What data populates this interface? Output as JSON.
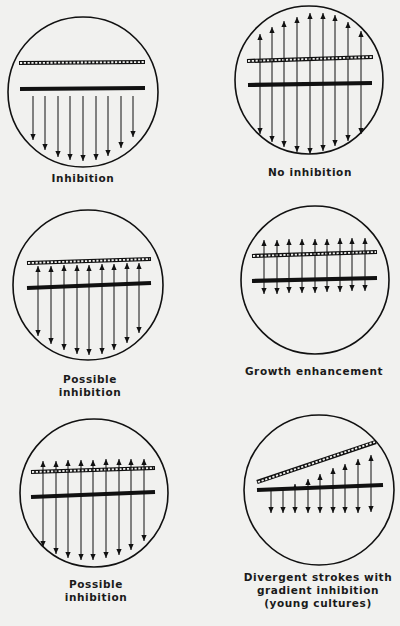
{
  "figure": {
    "panels": [
      {
        "id": "inhibition",
        "caption_lines": [
          "Inhibition"
        ],
        "circle": {
          "cx": 83,
          "cy": 92,
          "r": 75
        },
        "hatched_streak": {
          "x1": 19,
          "y1": 63,
          "x2": 145,
          "y2": 62
        },
        "solid_streak": {
          "x1": 20,
          "y1": 89,
          "x2": 145,
          "y2": 88
        },
        "arrows": [
          {
            "x": 33,
            "y_top": 96,
            "y_bottom": 140,
            "up": false
          },
          {
            "x": 45,
            "y_top": 96,
            "y_bottom": 150,
            "up": false
          },
          {
            "x": 58,
            "y_top": 96,
            "y_bottom": 157,
            "up": false
          },
          {
            "x": 70,
            "y_top": 96,
            "y_bottom": 160,
            "up": false
          },
          {
            "x": 83,
            "y_top": 96,
            "y_bottom": 161,
            "up": false
          },
          {
            "x": 96,
            "y_top": 96,
            "y_bottom": 160,
            "up": false
          },
          {
            "x": 108,
            "y_top": 96,
            "y_bottom": 156,
            "up": false
          },
          {
            "x": 121,
            "y_top": 96,
            "y_bottom": 148,
            "up": false
          },
          {
            "x": 133,
            "y_top": 96,
            "y_bottom": 137,
            "up": false
          }
        ],
        "caption_pos": {
          "x": 83,
          "y": 172
        }
      },
      {
        "id": "no-inhibition",
        "caption_lines": [
          "No inhibition"
        ],
        "circle": {
          "cx": 309,
          "cy": 80,
          "r": 74
        },
        "hatched_streak": {
          "x1": 247,
          "y1": 61,
          "x2": 373,
          "y2": 57
        },
        "solid_streak": {
          "x1": 248,
          "y1": 85,
          "x2": 372,
          "y2": 83
        },
        "arrows": [
          {
            "x": 260,
            "y_top": 34,
            "y_bottom": 134,
            "up": true
          },
          {
            "x": 272,
            "y_top": 27,
            "y_bottom": 142,
            "up": true
          },
          {
            "x": 284,
            "y_top": 21,
            "y_bottom": 147,
            "up": true
          },
          {
            "x": 297,
            "y_top": 17,
            "y_bottom": 152,
            "up": true
          },
          {
            "x": 310,
            "y_top": 13,
            "y_bottom": 154,
            "up": true
          },
          {
            "x": 323,
            "y_top": 13,
            "y_bottom": 151,
            "up": true
          },
          {
            "x": 335,
            "y_top": 15,
            "y_bottom": 146,
            "up": true
          },
          {
            "x": 348,
            "y_top": 22,
            "y_bottom": 141,
            "up": true
          },
          {
            "x": 361,
            "y_top": 31,
            "y_bottom": 134,
            "up": true
          }
        ],
        "caption_pos": {
          "x": 310,
          "y": 166
        }
      },
      {
        "id": "possible-inhibition-1",
        "caption_lines": [
          "Possible",
          "inhibition"
        ],
        "circle": {
          "cx": 88,
          "cy": 285,
          "r": 75
        },
        "hatched_streak": {
          "x1": 27,
          "y1": 263,
          "x2": 151,
          "y2": 259
        },
        "solid_streak": {
          "x1": 27,
          "y1": 288,
          "x2": 151,
          "y2": 283
        },
        "arrows": [
          {
            "x": 38,
            "y_top": 266,
            "y_bottom": 336,
            "up": true
          },
          {
            "x": 51,
            "y_top": 266,
            "y_bottom": 344,
            "up": true
          },
          {
            "x": 64,
            "y_top": 265,
            "y_bottom": 350,
            "up": true
          },
          {
            "x": 77,
            "y_top": 265,
            "y_bottom": 354,
            "up": true
          },
          {
            "x": 89,
            "y_top": 265,
            "y_bottom": 355,
            "up": true
          },
          {
            "x": 102,
            "y_top": 264,
            "y_bottom": 354,
            "up": true
          },
          {
            "x": 114,
            "y_top": 264,
            "y_bottom": 350,
            "up": true
          },
          {
            "x": 127,
            "y_top": 263,
            "y_bottom": 343,
            "up": true
          },
          {
            "x": 139,
            "y_top": 263,
            "y_bottom": 333,
            "up": true
          }
        ],
        "caption_pos": {
          "x": 90,
          "y": 373
        }
      },
      {
        "id": "growth-enhancement",
        "caption_lines": [
          "Growth enhancement"
        ],
        "circle": {
          "cx": 315,
          "cy": 280,
          "r": 74
        },
        "hatched_streak": {
          "x1": 252,
          "y1": 256,
          "x2": 377,
          "y2": 252
        },
        "solid_streak": {
          "x1": 252,
          "y1": 281,
          "x2": 377,
          "y2": 278
        },
        "arrows": [
          {
            "x": 264,
            "y_top": 240,
            "y_bottom": 294,
            "up": true
          },
          {
            "x": 277,
            "y_top": 240,
            "y_bottom": 294,
            "up": true
          },
          {
            "x": 289,
            "y_top": 239,
            "y_bottom": 293,
            "up": true
          },
          {
            "x": 302,
            "y_top": 239,
            "y_bottom": 293,
            "up": true
          },
          {
            "x": 315,
            "y_top": 239,
            "y_bottom": 293,
            "up": true
          },
          {
            "x": 327,
            "y_top": 239,
            "y_bottom": 292,
            "up": true
          },
          {
            "x": 340,
            "y_top": 238,
            "y_bottom": 292,
            "up": true
          },
          {
            "x": 352,
            "y_top": 238,
            "y_bottom": 291,
            "up": true
          },
          {
            "x": 365,
            "y_top": 238,
            "y_bottom": 291,
            "up": true
          }
        ],
        "caption_pos": {
          "x": 314,
          "y": 365
        }
      },
      {
        "id": "possible-inhibition-2",
        "caption_lines": [
          "Possible",
          "inhibition"
        ],
        "circle": {
          "cx": 94,
          "cy": 493,
          "r": 74
        },
        "hatched_streak": {
          "x1": 31,
          "y1": 472,
          "x2": 155,
          "y2": 468
        },
        "solid_streak": {
          "x1": 31,
          "y1": 497,
          "x2": 155,
          "y2": 492
        },
        "arrows": [
          {
            "x": 43,
            "y_top": 461,
            "y_bottom": 547,
            "up": true
          },
          {
            "x": 56,
            "y_top": 461,
            "y_bottom": 554,
            "up": true
          },
          {
            "x": 68,
            "y_top": 460,
            "y_bottom": 558,
            "up": true
          },
          {
            "x": 81,
            "y_top": 460,
            "y_bottom": 560,
            "up": true
          },
          {
            "x": 93,
            "y_top": 460,
            "y_bottom": 560,
            "up": true
          },
          {
            "x": 106,
            "y_top": 459,
            "y_bottom": 558,
            "up": true
          },
          {
            "x": 119,
            "y_top": 459,
            "y_bottom": 555,
            "up": true
          },
          {
            "x": 131,
            "y_top": 459,
            "y_bottom": 550,
            "up": true
          },
          {
            "x": 144,
            "y_top": 459,
            "y_bottom": 541,
            "up": true
          }
        ],
        "caption_pos": {
          "x": 96,
          "y": 578
        }
      },
      {
        "id": "divergent-strokes",
        "caption_lines": [
          "Divergent strokes with",
          "gradient inhibition",
          "(young cultures)"
        ],
        "circle": {
          "cx": 319,
          "cy": 490,
          "r": 75
        },
        "hatched_streak": {
          "x1": 257,
          "y1": 482,
          "x2": 376,
          "y2": 442
        },
        "solid_streak": {
          "x1": 257,
          "y1": 490,
          "x2": 383,
          "y2": 485
        },
        "arrows": [
          {
            "x": 271,
            "y_top": 490,
            "y_bottom": 513,
            "up": false
          },
          {
            "x": 283,
            "y_top": 490,
            "y_bottom": 513,
            "up": false
          },
          {
            "x": 295,
            "y_top": 484,
            "y_bottom": 513,
            "up": true
          },
          {
            "x": 308,
            "y_top": 479,
            "y_bottom": 513,
            "up": true
          },
          {
            "x": 320,
            "y_top": 474,
            "y_bottom": 513,
            "up": true
          },
          {
            "x": 333,
            "y_top": 468,
            "y_bottom": 513,
            "up": true
          },
          {
            "x": 345,
            "y_top": 464,
            "y_bottom": 513,
            "up": true
          },
          {
            "x": 358,
            "y_top": 459,
            "y_bottom": 513,
            "up": true
          },
          {
            "x": 371,
            "y_top": 455,
            "y_bottom": 512,
            "up": true
          }
        ],
        "caption_pos": {
          "x": 318,
          "y": 571
        }
      }
    ]
  }
}
